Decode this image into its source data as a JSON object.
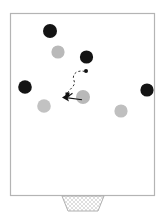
{
  "diagram": {
    "type": "sports-play-diagram",
    "canvas": {
      "width": 165,
      "height": 221
    },
    "colors": {
      "background": "#ffffff",
      "field_fill": "#ffffff",
      "field_stroke": "#b4b4b4",
      "team_dark": "#141414",
      "team_light": "#b9b9b9",
      "ball": "#111111",
      "path_stroke": "#2b2b2b",
      "arrow_stroke": "#111111",
      "net_stroke": "#c2c2c2"
    },
    "field": {
      "label": "playing-field",
      "x": 10.5,
      "y": 13.5,
      "width": 144,
      "height": 182,
      "stroke_width": 1.2
    },
    "goal": {
      "label": "goal-with-net",
      "top_left_x": 62,
      "top_right_x": 104,
      "bottom_left_x": 68,
      "bottom_right_x": 98,
      "top_y": 196,
      "bottom_y": 211,
      "net_spacing": 4
    },
    "players_dark": [
      {
        "id": "dark-1",
        "cx": 50,
        "cy": 31,
        "r": 7.0
      },
      {
        "id": "dark-2",
        "cx": 86.5,
        "cy": 57,
        "r": 6.6
      },
      {
        "id": "dark-3",
        "cx": 25,
        "cy": 87,
        "r": 6.8
      },
      {
        "id": "dark-4",
        "cx": 147,
        "cy": 90,
        "r": 6.6
      }
    ],
    "players_light": [
      {
        "id": "light-1",
        "cx": 58,
        "cy": 52,
        "r": 6.6
      },
      {
        "id": "light-2",
        "cx": 83,
        "cy": 97,
        "r": 7.0
      },
      {
        "id": "light-3",
        "cx": 44,
        "cy": 106,
        "r": 6.8
      },
      {
        "id": "light-4",
        "cx": 121,
        "cy": 111,
        "r": 6.6
      }
    ],
    "ball": {
      "label": "ball",
      "cx": 86,
      "cy": 71,
      "r": 2.0
    },
    "paths": [
      {
        "id": "dashed-ball-path",
        "style": "dashed",
        "d": "M 85.5 71.5 C 76 70 72 74 74 80 C 76 86 68 88 66 95",
        "dash": "2.2 2.2",
        "width": 1.0
      },
      {
        "id": "solid-run-arrow",
        "style": "solid",
        "d": "M 82 99.5 L 66 97.5",
        "width": 1.1,
        "arrowhead_at": "start-end-left"
      },
      {
        "id": "solid-run-arrow-2",
        "style": "solid",
        "d": "M 66 97.5 L 72 93.5",
        "width": 1.1
      }
    ],
    "marker": {
      "label": "player-position-marker",
      "cx": 64.5,
      "cy": 97.5,
      "size": 5
    }
  }
}
